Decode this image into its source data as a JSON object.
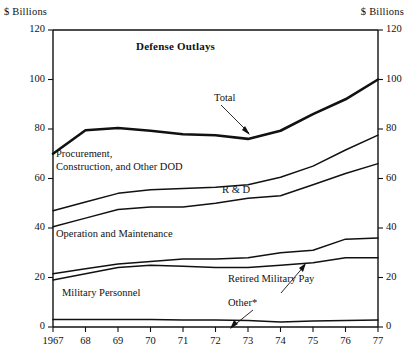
{
  "axis_units": {
    "left": "$ Billions",
    "right": "$ Billions"
  },
  "chart_data": {
    "type": "line",
    "title": "Defense Outlays",
    "xlabel": "",
    "ylabel": "$ Billions",
    "ylim": [
      0,
      120
    ],
    "yticks": [
      0,
      20,
      40,
      60,
      80,
      100,
      120
    ],
    "grid": false,
    "legend": "inline-annotations",
    "x": [
      1967,
      1968,
      1969,
      1970,
      1971,
      1972,
      1973,
      1974,
      1975,
      1976,
      1977
    ],
    "xticklabels": [
      "1967",
      "68",
      "69",
      "70",
      "71",
      "72",
      "73",
      "74",
      "75",
      "76",
      "77"
    ],
    "note": "Cumulative (stacked) outlay bands; each series line is the running total of the bands below it.",
    "footnote": "*",
    "series": [
      {
        "name": "Total",
        "emphasis": "heavy",
        "values": [
          70.0,
          79.5,
          80.4,
          79.3,
          77.9,
          77.5,
          76.0,
          79.3,
          86.0,
          92.0,
          100.0
        ]
      },
      {
        "name": "Procurement, Construction, and Other DOD",
        "emphasis": "normal",
        "values": [
          47.0,
          50.5,
          54.0,
          55.5,
          56.0,
          56.5,
          57.5,
          60.5,
          65.0,
          71.5,
          77.5
        ]
      },
      {
        "name": "R & D",
        "emphasis": "normal",
        "values": [
          40.5,
          44.0,
          47.5,
          48.5,
          48.5,
          50.0,
          52.0,
          53.0,
          57.5,
          62.0,
          66.0
        ]
      },
      {
        "name": "Operation and Maintenance",
        "emphasis": "normal",
        "values": [
          21.5,
          23.5,
          25.5,
          26.5,
          27.5,
          27.5,
          28.0,
          30.0,
          31.0,
          35.5,
          36.0
        ]
      },
      {
        "name": "Retired Military Pay",
        "emphasis": "normal",
        "values": [
          19.0,
          21.5,
          24.0,
          25.0,
          24.5,
          24.0,
          24.0,
          25.0,
          26.0,
          28.0,
          28.0
        ]
      },
      {
        "name": "Other*",
        "emphasis": "normal",
        "values": [
          3.0,
          3.0,
          3.0,
          3.0,
          2.8,
          2.8,
          2.6,
          2.0,
          2.4,
          2.6,
          2.8
        ]
      }
    ]
  },
  "annotations": {
    "total": "Total",
    "procurement_line1": "Procurement,",
    "procurement_line2": "Construction, and Other DOD",
    "rd": "R & D",
    "om": "Operation and Maintenance",
    "military_personnel": "Military Personnel",
    "retired_military_pay": "Retired Military Pay",
    "other": "Other*"
  }
}
